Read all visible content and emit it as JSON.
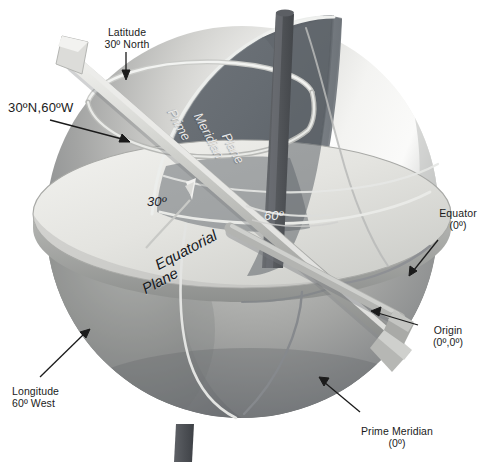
{
  "diagram": {
    "type": "3d-globe-schematic"
  },
  "callouts": {
    "latitude_ring": "Latitude\n30º North",
    "coordinate_point": "30ºN,60ºW",
    "equator": "Equator\n(0º)",
    "origin": "Origin\n(0º,0º)",
    "prime_meridian": "Prime Meridian\n(0º)",
    "longitude_line": "Longitude\n60º West"
  },
  "plane_labels": {
    "prime_meridian_plane_1": "Prime",
    "prime_meridian_plane_2": "Meridian",
    "prime_meridian_plane_3": "Plane",
    "equatorial_plane_1": "Equatorial",
    "equatorial_plane_2": "Plane"
  },
  "angle_labels": {
    "latitude_angle": "30º",
    "longitude_angle": "60º"
  },
  "colors": {
    "sphere_light": "#f2f2f0",
    "sphere_mid": "#9a9a98",
    "sphere_dark": "#6f7276",
    "plane_dark": "#646a70",
    "plane_light": "#d8d8d4",
    "rod": "#b9bab6",
    "axis_rod": "#55585c",
    "text": "#1b1b1b",
    "background": "#ffffff"
  }
}
